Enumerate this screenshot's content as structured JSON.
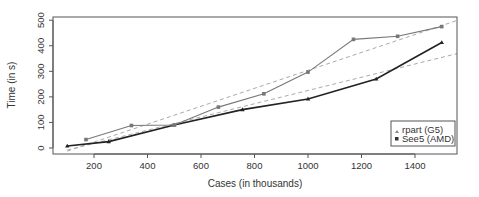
{
  "chart_data": {
    "type": "line",
    "title": "",
    "xlabel": "Cases (in thousands)",
    "ylabel": "Time (in s)",
    "xlim": [
      60,
      1560
    ],
    "ylim": [
      -20,
      515
    ],
    "x_ticks": [
      200,
      400,
      600,
      800,
      1000,
      1200,
      1400
    ],
    "y_ticks": [
      0,
      100,
      200,
      300,
      400,
      500
    ],
    "grid": false,
    "legend_position": "bottom-right",
    "series": [
      {
        "name": "rpart (G5)",
        "marker": "triangle",
        "color": "#222222",
        "x": [
          100,
          255,
          500,
          755,
          1000,
          1255,
          1500
        ],
        "y": [
          8,
          25,
          90,
          150,
          192,
          270,
          413
        ]
      },
      {
        "name": "See5 (AMD)",
        "marker": "square",
        "color": "#777777",
        "x": [
          170,
          340,
          500,
          665,
          835,
          1000,
          1170,
          1335,
          1500
        ],
        "y": [
          33,
          88,
          90,
          160,
          212,
          297,
          425,
          437,
          475
        ]
      }
    ],
    "trend_lines": [
      {
        "name": "See5 linear fit",
        "style": "dashed",
        "color": "#aaaaaa",
        "x": [
          100,
          1560
        ],
        "y": [
          -12,
          500
        ]
      },
      {
        "name": "rpart linear fit",
        "style": "dashed",
        "color": "#aaaaaa",
        "x": [
          100,
          1560
        ],
        "y": [
          -8,
          370
        ]
      }
    ]
  },
  "legend": {
    "items": [
      {
        "label": "rpart (G5)",
        "marker": "triangle"
      },
      {
        "label": "See5 (AMD)",
        "marker": "square"
      }
    ]
  },
  "axes": {
    "xlabel": "Cases (in thousands)",
    "ylabel": "Time (in s)",
    "x_tick_labels": [
      "200",
      "400",
      "600",
      "800",
      "1000",
      "1200",
      "1400"
    ],
    "y_tick_labels": [
      "0",
      "100",
      "200",
      "300",
      "400",
      "500"
    ]
  }
}
